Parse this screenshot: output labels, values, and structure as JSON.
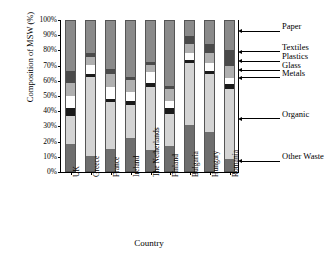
{
  "chart_data": {
    "type": "bar",
    "subtype": "stacked-100-percent",
    "title": "",
    "xlabel": "Country",
    "ylabel": "Composition of MSW (%)",
    "ylim": [
      0,
      100
    ],
    "ytick_labels": [
      "0%",
      "10%",
      "20%",
      "30%",
      "40%",
      "50%",
      "60%",
      "70%",
      "80%",
      "90%",
      "100%"
    ],
    "ytick_values": [
      0,
      10,
      20,
      30,
      40,
      50,
      60,
      70,
      80,
      90,
      100
    ],
    "grid": false,
    "legend_position": "right-callouts",
    "categories": [
      "UK",
      "Greece",
      "France",
      "Ireland",
      "The Netherlands",
      "Finland",
      "Bulgaria",
      "Hungary",
      "Romania"
    ],
    "series": [
      {
        "name": "Other Waste",
        "color": "#6e6e6e",
        "values": [
          18,
          10,
          15,
          22,
          14,
          17,
          31,
          26,
          8
        ]
      },
      {
        "name": "Organic",
        "color": "#d4d4d4",
        "values": [
          19,
          53,
          31,
          22,
          42,
          21,
          41,
          39,
          47
        ]
      },
      {
        "name": "Metals",
        "color": "#1a1a1a",
        "values": [
          5,
          2,
          2,
          3,
          3,
          4,
          2,
          2,
          3
        ]
      },
      {
        "name": "Glass",
        "color": "#ffffff",
        "values": [
          8,
          6,
          8,
          6,
          7,
          5,
          5,
          5,
          4
        ]
      },
      {
        "name": "Plastics",
        "color": "#b0b0b0",
        "values": [
          9,
          5,
          9,
          8,
          5,
          8,
          6,
          7,
          8
        ]
      },
      {
        "name": "Textiles",
        "color": "#4a4a4a",
        "values": [
          8,
          3,
          3,
          2,
          2,
          2,
          5,
          6,
          11
        ]
      },
      {
        "name": "Paper",
        "color": "#8a8a8a",
        "values": [
          33,
          21,
          32,
          37,
          27,
          43,
          10,
          15,
          19
        ]
      }
    ],
    "legend_entries": [
      {
        "label": "Paper",
        "y_percent": 92.5
      },
      {
        "label": "Textiles",
        "y_percent": 79.0
      },
      {
        "label": "Plastics",
        "y_percent": 73.0
      },
      {
        "label": "Glass",
        "y_percent": 67.0
      },
      {
        "label": "Metals",
        "y_percent": 62.0
      },
      {
        "label": "Organic",
        "y_percent": 35.0
      },
      {
        "label": "Other Waste",
        "y_percent": 7.0
      }
    ]
  }
}
